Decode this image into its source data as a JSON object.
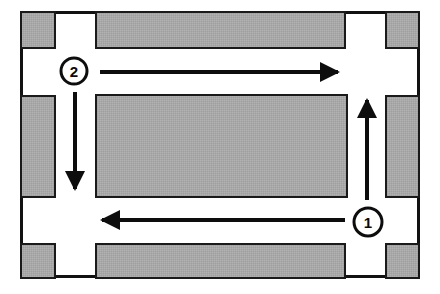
{
  "diagram": {
    "type": "floor-plan-flow-diagram",
    "canvas": {
      "width": 440,
      "height": 294
    },
    "colors": {
      "background": "#ffffff",
      "block_fill": "#a8a8a8",
      "block_stroke": "#1a1a1a",
      "outline": "#111111",
      "arrow": "#0d0d0d",
      "marker_stroke": "#0d0d0d",
      "marker_fill": "#ffffff",
      "label_text": "#0a0a0a"
    },
    "outline": {
      "x": 20,
      "y": 11,
      "width": 400,
      "height": 267,
      "stroke_width": 3
    },
    "blocks": [
      {
        "name": "top-left-block",
        "x": 21,
        "y": 12,
        "width": 34,
        "height": 36
      },
      {
        "name": "top-center-block",
        "x": 96,
        "y": 12,
        "width": 249,
        "height": 36
      },
      {
        "name": "top-right-block",
        "x": 386,
        "y": 12,
        "width": 33,
        "height": 36
      },
      {
        "name": "middle-left-block",
        "x": 21,
        "y": 96,
        "width": 34,
        "height": 101
      },
      {
        "name": "center-block",
        "x": 96,
        "y": 95,
        "width": 251,
        "height": 102
      },
      {
        "name": "middle-right-block",
        "x": 386,
        "y": 96,
        "width": 33,
        "height": 101
      },
      {
        "name": "bottom-left-block",
        "x": 21,
        "y": 244,
        "width": 34,
        "height": 34
      },
      {
        "name": "bottom-center-block",
        "x": 96,
        "y": 244,
        "width": 249,
        "height": 34
      },
      {
        "name": "bottom-right-block",
        "x": 386,
        "y": 244,
        "width": 33,
        "height": 34
      }
    ],
    "arrows": [
      {
        "name": "top-arrow-rightward",
        "direction": "right",
        "x1": 100,
        "y1": 72,
        "x2": 345,
        "y2": 72,
        "stroke_width": 4
      },
      {
        "name": "left-arrow-downward",
        "direction": "down",
        "x1": 75,
        "y1": 92,
        "x2": 75,
        "y2": 196,
        "stroke_width": 4
      },
      {
        "name": "bottom-arrow-leftward",
        "direction": "left",
        "x1": 345,
        "y1": 220,
        "x2": 95,
        "y2": 220,
        "stroke_width": 4
      },
      {
        "name": "right-arrow-upward",
        "direction": "up",
        "x1": 367,
        "y1": 200,
        "x2": 367,
        "y2": 93,
        "stroke_width": 4
      }
    ],
    "markers": [
      {
        "name": "step-marker-1",
        "label": "1",
        "cx": 368,
        "cy": 222,
        "r": 14,
        "stroke_width": 3
      },
      {
        "name": "step-marker-2",
        "label": "2",
        "cx": 74,
        "cy": 71,
        "r": 13,
        "stroke_width": 3
      }
    ]
  }
}
